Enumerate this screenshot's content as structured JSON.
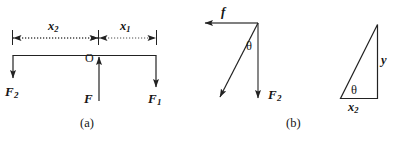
{
  "figure": {
    "background_color": "#ffffff",
    "stroke_color": "#222222",
    "text_color": "#151515",
    "width": 394,
    "height": 145,
    "panels": [
      {
        "id": "a",
        "caption": "(a)",
        "description": "Horizontal beam with pivot O, upward force F, downward forces F1 and F2, and dimension line showing x2 and x1"
      },
      {
        "id": "b",
        "caption": "(b)",
        "description": "Vector diagram of f and F2 with included angle theta, plus a right triangle with legs x2 and y and angle theta"
      }
    ]
  },
  "panel_a": {
    "caption": "(a)",
    "pivot_label": "O",
    "dimension_left": {
      "symbol": "x",
      "subscript": "2"
    },
    "dimension_right": {
      "symbol": "x",
      "subscript": "1"
    },
    "force_left": {
      "symbol": "F",
      "subscript": "2",
      "direction": "down"
    },
    "force_center": {
      "symbol": "F",
      "subscript": "",
      "direction": "up"
    },
    "force_right": {
      "symbol": "F",
      "subscript": "1",
      "direction": "down"
    }
  },
  "panel_b": {
    "caption": "(b)",
    "vector_friction": {
      "symbol": "f",
      "subscript": "",
      "direction": "left"
    },
    "vector_weight": {
      "symbol": "F",
      "subscript": "2",
      "direction": "down"
    },
    "angle_label": "θ",
    "triangle_angle_label": "θ",
    "triangle_vertical_leg": {
      "symbol": "y",
      "subscript": ""
    },
    "triangle_horizontal_leg": {
      "symbol": "x",
      "subscript": "2"
    }
  }
}
